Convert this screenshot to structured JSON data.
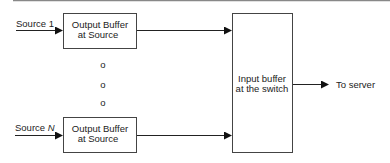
{
  "diagram": {
    "sources": [
      {
        "label": "Source 1",
        "label_prefix": "Source",
        "label_suffix": "1",
        "box_line1": "Output Buffer",
        "box_line2": "at Source"
      },
      {
        "label": "Source N",
        "label_prefix": "Source",
        "label_suffix": "N",
        "box_line1": "Output Buffer",
        "box_line2": "at Source"
      }
    ],
    "ellipsis_dots": [
      "o",
      "o",
      "o"
    ],
    "switch_box": {
      "line1": "Input buffer",
      "line2": "at the switch"
    },
    "output_label": "To server",
    "colors": {
      "line": "#333333",
      "box_border": "#555555",
      "top_rule": "#777777"
    }
  }
}
